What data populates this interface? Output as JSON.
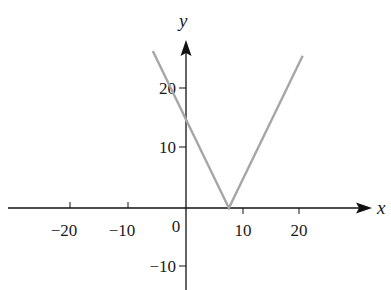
{
  "chart_data": {
    "type": "line",
    "title": "",
    "function": "y = |2x - 15|",
    "xlabel": "x",
    "ylabel": "y",
    "xlim": [
      -31,
      31
    ],
    "ylim": [
      -14,
      31
    ],
    "grid": false,
    "legend": null,
    "x_ticks": [
      -20,
      -10,
      10,
      20
    ],
    "x_tick_labels": [
      "−20",
      "−10",
      "10",
      "20"
    ],
    "y_ticks": [
      -10,
      10,
      20
    ],
    "y_tick_labels": [
      "−10",
      "10",
      "20"
    ],
    "origin_label": "0",
    "series": [
      {
        "name": "y = |2x - 15|",
        "color": "#a6a6a6",
        "points": [
          [
            -5.8,
            26.6
          ],
          [
            0,
            15
          ],
          [
            7.5,
            0
          ],
          [
            20.4,
            25.8
          ]
        ]
      }
    ],
    "annotations": []
  },
  "style": {
    "axis_color": "#111111",
    "curve_color": "#a6a6a6"
  }
}
